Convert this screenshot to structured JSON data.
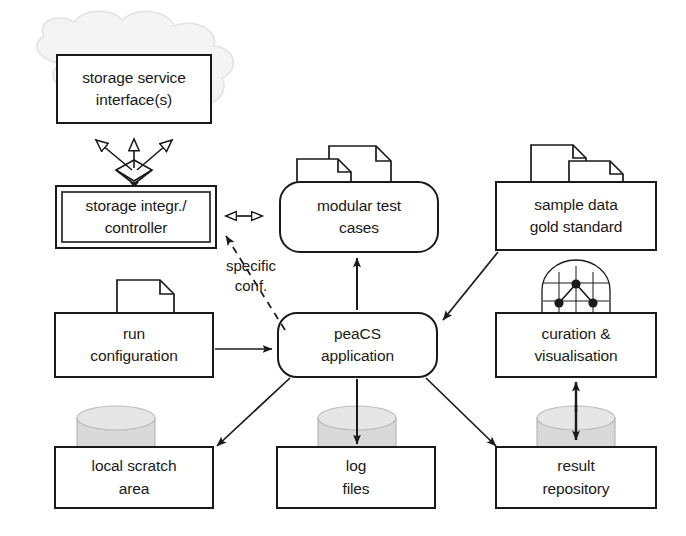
{
  "diagram": {
    "background_color": "#ffffff",
    "line_color": "#1a1a1a",
    "cloud_color": "#f2f2f2",
    "cylinder_fill": "#d8d8d8",
    "nodes": [
      {
        "id": "storage-service-interfaces",
        "kind": "box-in-cloud",
        "lines": [
          "storage service",
          "interface(s)"
        ],
        "x": 57,
        "y": 55,
        "w": 154,
        "h": 68
      },
      {
        "id": "storage-integrator-controller",
        "kind": "double-box",
        "lines": [
          "storage integr./",
          "controller"
        ],
        "x": 56,
        "y": 186,
        "w": 160,
        "h": 62
      },
      {
        "id": "modular-test-cases",
        "kind": "rounded-box-with-documents",
        "lines": [
          "modular test",
          "cases"
        ],
        "x": 280,
        "y": 182,
        "w": 158,
        "h": 70
      },
      {
        "id": "sample-data-gold-standard",
        "kind": "box-with-documents",
        "lines": [
          "sample data",
          "gold standard"
        ],
        "x": 496,
        "y": 182,
        "w": 160,
        "h": 68
      },
      {
        "id": "run-configuration",
        "kind": "box-with-document",
        "lines": [
          "run",
          "configuration"
        ],
        "x": 55,
        "y": 313,
        "w": 158,
        "h": 64
      },
      {
        "id": "peacs-application",
        "kind": "rounded-box",
        "lines": [
          "peaCS",
          "application"
        ],
        "x": 278,
        "y": 313,
        "w": 159,
        "h": 64
      },
      {
        "id": "curation-visualisation",
        "kind": "box-with-chart",
        "lines": [
          "curation &",
          "visualisation"
        ],
        "x": 496,
        "y": 313,
        "w": 160,
        "h": 64
      },
      {
        "id": "local-scratch-area",
        "kind": "box-with-cylinder",
        "lines": [
          "local scratch",
          "area"
        ],
        "x": 55,
        "y": 447,
        "w": 158,
        "h": 61
      },
      {
        "id": "log-files",
        "kind": "box-with-cylinder",
        "lines": [
          "log",
          "files"
        ],
        "x": 277,
        "y": 447,
        "w": 158,
        "h": 61
      },
      {
        "id": "result-repository",
        "kind": "box-with-cylinder",
        "lines": [
          "result",
          "repository"
        ],
        "x": 496,
        "y": 447,
        "w": 160,
        "h": 61
      }
    ],
    "edge_labels": [
      {
        "id": "specific-conf",
        "lines": [
          "specific",
          "conf."
        ],
        "x": 211,
        "y": 258
      }
    ],
    "edges": [
      {
        "from": "storage-integrator-controller",
        "to": "storage-service-interfaces",
        "style": "generalization-triple"
      },
      {
        "from": "storage-integrator-controller",
        "to": "modular-test-cases",
        "style": "hollow-double-arrow"
      },
      {
        "from": "peacs-application",
        "to": "storage-integrator-controller",
        "style": "dashed-filled-arrow"
      },
      {
        "from": "peacs-application",
        "to": "modular-test-cases",
        "style": "filled-arrow"
      },
      {
        "from": "sample-data-gold-standard",
        "to": "peacs-application",
        "style": "filled-arrow"
      },
      {
        "from": "run-configuration",
        "to": "peacs-application",
        "style": "filled-arrow"
      },
      {
        "from": "peacs-application",
        "to": "local-scratch-area",
        "style": "filled-arrow"
      },
      {
        "from": "peacs-application",
        "to": "log-files",
        "style": "filled-arrow"
      },
      {
        "from": "peacs-application",
        "to": "result-repository",
        "style": "filled-arrow"
      },
      {
        "from": "result-repository",
        "to": "curation-visualisation",
        "style": "filled-double-arrow"
      }
    ]
  }
}
